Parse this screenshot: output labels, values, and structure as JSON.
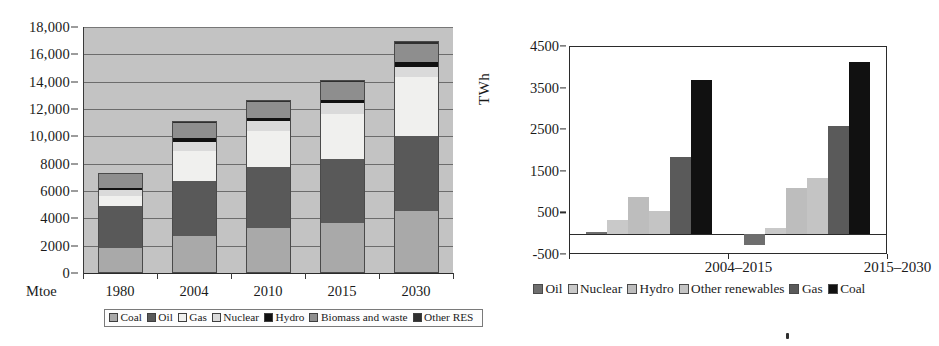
{
  "chart_data": [
    {
      "id": "world-primary-energy-demand",
      "type": "bar",
      "subtype": "stacked-bar",
      "title": "",
      "xlabel": "Mtoe",
      "ylabel": "",
      "ylim": [
        0,
        18000
      ],
      "ytick_labels": [
        "0",
        "2000",
        "4000",
        "6000",
        "8000",
        "10,000",
        "12,000",
        "14,000",
        "16,000",
        "18,000"
      ],
      "ytick_values": [
        0,
        2000,
        4000,
        6000,
        8000,
        10000,
        12000,
        14000,
        16000,
        18000
      ],
      "grid": true,
      "legend_position": "bottom",
      "plot_background": "#c3c3c3",
      "categories": [
        "1980",
        "2004",
        "2010",
        "2015",
        "2030"
      ],
      "series": [
        {
          "name": "Coal",
          "color": "#a9a9a9",
          "values": [
            1750,
            2650,
            3250,
            3600,
            4450
          ]
        },
        {
          "name": "Oil",
          "color": "#595959",
          "values": [
            3100,
            4000,
            4450,
            4700,
            5500
          ]
        },
        {
          "name": "Gas",
          "color": "#f0f0ee",
          "values": [
            700,
            2200,
            2600,
            3250,
            4350
          ]
        },
        {
          "name": "Nuclear",
          "color": "#dadada",
          "values": [
            450,
            700,
            750,
            800,
            700
          ]
        },
        {
          "name": "Hydro",
          "color": "#111111",
          "values": [
            150,
            250,
            250,
            250,
            350
          ]
        },
        {
          "name": "Biomass and waste",
          "color": "#8e8e8e",
          "values": [
            1000,
            1100,
            1150,
            1300,
            1300
          ]
        },
        {
          "name": "Other RES",
          "color": "#2f2f2f",
          "values": [
            50,
            50,
            50,
            100,
            150
          ]
        }
      ],
      "totals": [
        7200,
        10950,
        12500,
        14000,
        16800
      ]
    },
    {
      "id": "incremental-power-generation",
      "type": "bar",
      "subtype": "grouped-bar",
      "title": "",
      "xlabel": "",
      "ylabel": "TWh",
      "ylim": [
        -500,
        4500
      ],
      "ytick_labels": [
        "-500",
        "500",
        "1500",
        "2500",
        "3500",
        "4500"
      ],
      "ytick_values": [
        -500,
        500,
        1500,
        2500,
        3500,
        4500
      ],
      "grid": false,
      "legend_position": "bottom",
      "plot_background": "#ffffff",
      "categories": [
        "2004–2015",
        "2015–2030"
      ],
      "series": [
        {
          "name": "Oil",
          "color": "#6e6e6e",
          "values": [
            50,
            -250
          ]
        },
        {
          "name": "Nuclear",
          "color": "#c9c9c9",
          "values": [
            350,
            150
          ]
        },
        {
          "name": "Hydro",
          "color": "#bdbdbd",
          "values": [
            900,
            1100
          ]
        },
        {
          "name": "Other renewables",
          "color": "#c4c4c4",
          "values": [
            550,
            1350
          ]
        },
        {
          "name": "Gas",
          "color": "#5a5a5a",
          "values": [
            1850,
            2600
          ]
        },
        {
          "name": "Coal",
          "color": "#111111",
          "values": [
            3700,
            4150
          ]
        }
      ]
    }
  ],
  "left_chart": {
    "axis_caption": "Mtoe",
    "y_ticks": [
      "18,000",
      "16,000",
      "14,000",
      "12,000",
      "10,000",
      "8000",
      "6000",
      "4000",
      "2000",
      "0"
    ],
    "x_ticks": [
      "1980",
      "2004",
      "2010",
      "2015",
      "2030"
    ],
    "legend": [
      {
        "label": "Coal",
        "color": "#a9a9a9"
      },
      {
        "label": "Oil",
        "color": "#595959"
      },
      {
        "label": "Gas",
        "color": "#f0f0ee"
      },
      {
        "label": "Nuclear",
        "color": "#dadada"
      },
      {
        "label": "Hydro",
        "color": "#111111"
      },
      {
        "label": "Biomass and waste",
        "color": "#8e8e8e"
      },
      {
        "label": "Other RES",
        "color": "#2f2f2f"
      }
    ]
  },
  "right_chart": {
    "y_axis_title": "TWh",
    "y_ticks": [
      "4500",
      "3500",
      "2500",
      "1500",
      "500",
      "-500"
    ],
    "x_ticks": [
      "2004–2015",
      "2015–2030"
    ],
    "legend": [
      {
        "label": "Oil",
        "color": "#6e6e6e"
      },
      {
        "label": "Nuclear",
        "color": "#c9c9c9"
      },
      {
        "label": "Hydro",
        "color": "#bdbdbd"
      },
      {
        "label": "Other renewables",
        "color": "#c4c4c4"
      },
      {
        "label": "Gas",
        "color": "#5a5a5a"
      },
      {
        "label": "Coal",
        "color": "#111111"
      }
    ]
  }
}
